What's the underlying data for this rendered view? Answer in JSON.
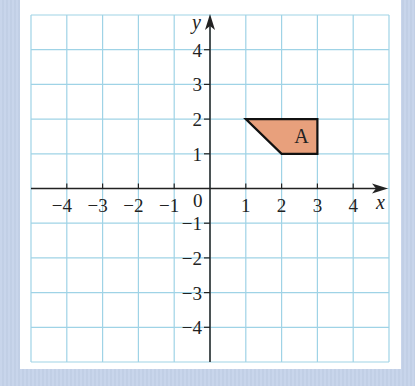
{
  "chart_data": {
    "type": "coordinate-grid",
    "title": "",
    "xlabel": "x",
    "ylabel": "y",
    "xlim": [
      -5,
      5
    ],
    "ylim": [
      -5,
      5
    ],
    "grid": true,
    "origin_label": "0",
    "x_tick_labels": [
      "-4",
      "-3",
      "-2",
      "-1",
      "1",
      "2",
      "3",
      "4"
    ],
    "x_tick_values": [
      -4,
      -3,
      -2,
      -1,
      1,
      2,
      3,
      4
    ],
    "y_tick_labels": [
      "4",
      "3",
      "2",
      "1",
      "-1",
      "-2",
      "-3",
      "-4"
    ],
    "y_tick_values": [
      4,
      3,
      2,
      1,
      -1,
      -2,
      -3,
      -4
    ],
    "shapes": [
      {
        "label": "A",
        "type": "trapezium",
        "vertices": [
          [
            1,
            2
          ],
          [
            3,
            2
          ],
          [
            3,
            1
          ],
          [
            2,
            1
          ]
        ],
        "fill": "#e8a07c",
        "stroke": "#111111"
      }
    ]
  },
  "colors": {
    "background": "#c5d3ea",
    "panel": "#ffffff",
    "grid": "#9fd3e6",
    "axis": "#222222",
    "shape_fill": "#e8a07c"
  }
}
